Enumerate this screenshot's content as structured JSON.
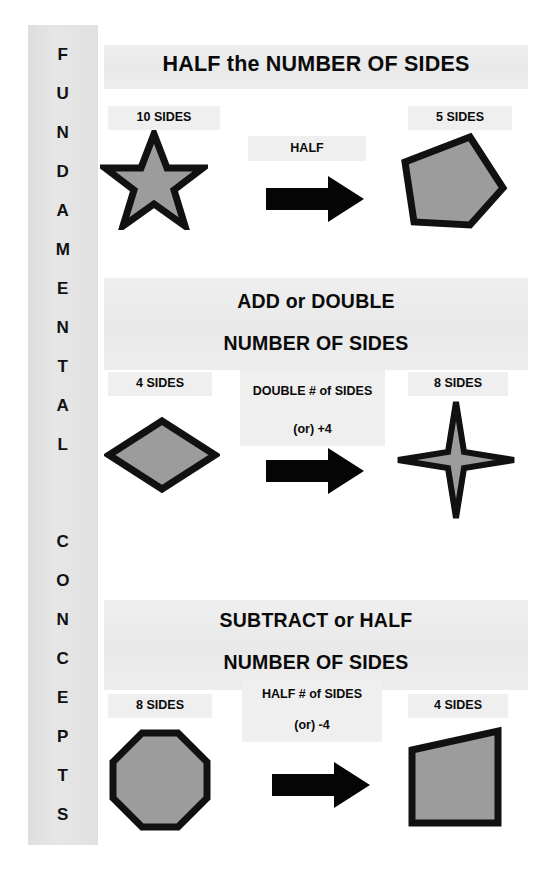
{
  "sidebar": {
    "word1": "FUNDAMENTAL",
    "word2": "CONCEPTS",
    "letters": [
      "F",
      "U",
      "N",
      "D",
      "A",
      "M",
      "E",
      "N",
      "T",
      "A",
      "L",
      "",
      "C",
      "O",
      "N",
      "C",
      "E",
      "P",
      "T",
      "S"
    ]
  },
  "colors": {
    "shape_fill": "#9c9c9c",
    "shape_stroke": "#111111",
    "arrow": "#050505",
    "band": "#ececec",
    "sidebar_band": "#e2e2e2",
    "text": "#0a0a0a"
  },
  "sections": [
    {
      "heading_lines": [
        "HALF the NUMBER OF SIDES"
      ],
      "left_label": "10 SIDES",
      "left_shape": "ten-point-star",
      "operation_label": "HALF",
      "operation_sub": "",
      "arrow": "right-arrow",
      "right_label": "5 SIDES",
      "right_shape": "pentagon"
    },
    {
      "heading_lines": [
        "ADD or DOUBLE",
        "NUMBER OF SIDES"
      ],
      "left_label": "4 SIDES",
      "left_shape": "rhombus",
      "operation_label": "DOUBLE # of SIDES",
      "operation_sub": "(or) +4",
      "arrow": "right-arrow",
      "right_label": "8 SIDES",
      "right_shape": "four-point-star"
    },
    {
      "heading_lines": [
        "SUBTRACT or HALF",
        "NUMBER OF SIDES"
      ],
      "left_label": "8 SIDES",
      "left_shape": "octagon",
      "operation_label": "HALF # of SIDES",
      "operation_sub": "(or) -4",
      "arrow": "right-arrow",
      "right_label": "4 SIDES",
      "right_shape": "trapezoid"
    }
  ]
}
